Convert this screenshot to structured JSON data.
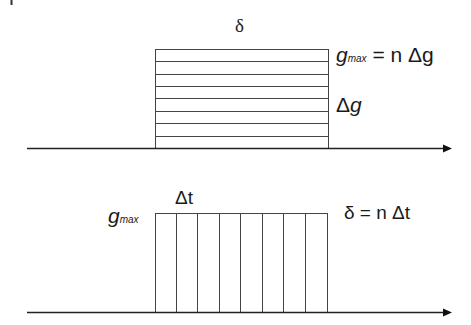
{
  "diagram": {
    "title": "",
    "top_panel": {
      "description": "Amplitude sliced into n horizontal increments of Δg over pulse duration δ",
      "label_top": "δ",
      "label_gmax": {
        "symbol": "g",
        "subscript": "max",
        "equation": "= n Δg"
      },
      "label_increment": {
        "delta": "Δ",
        "symbol": "g"
      },
      "strip_count": 8,
      "strip_orientation": "horizontal"
    },
    "bottom_panel": {
      "description": "Duration sliced into n vertical increments of Δt at amplitude g_max",
      "label_increment": "Δt",
      "label_gmax": {
        "symbol": "g",
        "subscript": "max"
      },
      "label_equation": "δ = n Δt",
      "strip_count": 8,
      "strip_orientation": "vertical"
    },
    "colors": {
      "line": "#333333",
      "text": "#1a1a1a",
      "background": "#ffffff"
    }
  }
}
